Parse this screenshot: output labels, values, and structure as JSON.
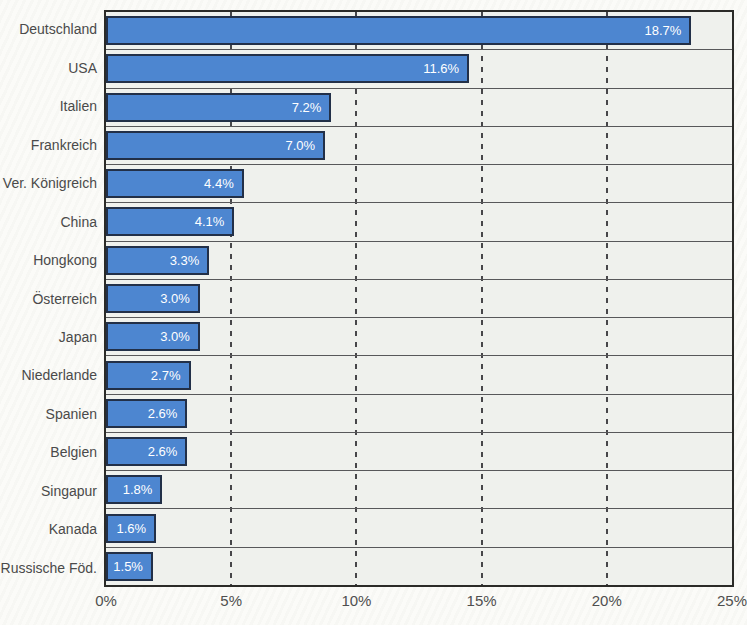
{
  "chart_data": {
    "type": "bar",
    "orientation": "horizontal",
    "title": "",
    "xlabel": "",
    "ylabel": "",
    "categories": [
      "Deutschland",
      "USA",
      "Italien",
      "Frankreich",
      "Ver. Königreich",
      "China",
      "Hongkong",
      "Österreich",
      "Japan",
      "Niederlande",
      "Spanien",
      "Belgien",
      "Singapur",
      "Kanada",
      "Russische Föd."
    ],
    "values": [
      18.7,
      11.6,
      7.2,
      7.0,
      4.4,
      4.1,
      3.3,
      3.0,
      3.0,
      2.7,
      2.6,
      2.6,
      1.8,
      1.6,
      1.5
    ],
    "value_labels": [
      "18.7%",
      "11.6%",
      "7.2%",
      "7.0%",
      "4.4%",
      "4.1%",
      "3.3%",
      "3.0%",
      "3.0%",
      "2.7%",
      "2.6%",
      "2.6%",
      "1.8%",
      "1.6%",
      "1.5%"
    ],
    "x_tick_values": [
      0,
      5,
      10,
      15,
      20,
      25
    ],
    "x_tick_labels": [
      "0%",
      "5%",
      "10%",
      "15%",
      "20%",
      "25%"
    ],
    "xlim": [
      0,
      25
    ],
    "bar_visual_scale_max": 20,
    "gridline_ticks": [
      5,
      10,
      15,
      20
    ],
    "grid": "vertical-dashed",
    "legend_position": "none"
  },
  "colors": {
    "page_bg": "#fbfbf8",
    "plot_bg": "#eff1ed",
    "plot_border": "#2b2b28",
    "row_line": "#58585a",
    "grid_color": "#47474a",
    "bar_fill": "#4d86d0",
    "bar_border": "#223048",
    "cat_label": "#4a4a4a",
    "axis_label": "#4f4f4f",
    "value_label": "#ffffff"
  }
}
